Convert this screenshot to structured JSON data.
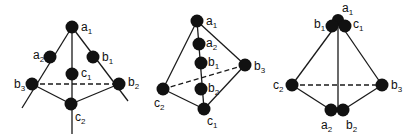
{
  "figures": [
    {
      "id": "fig1",
      "atoms": [
        {
          "name": "a1",
          "letter": "a",
          "sub": "1",
          "x": 72,
          "y": 27
        },
        {
          "name": "a2",
          "letter": "a",
          "sub": "2",
          "x": 50,
          "y": 57
        },
        {
          "name": "b1",
          "letter": "b",
          "sub": "1",
          "x": 93,
          "y": 57
        },
        {
          "name": "c1",
          "letter": "c",
          "sub": "1",
          "x": 72,
          "y": 74
        },
        {
          "name": "b3",
          "letter": "b",
          "sub": "3",
          "x": 32,
          "y": 84
        },
        {
          "name": "b2",
          "letter": "b",
          "sub": "2",
          "x": 119,
          "y": 84
        },
        {
          "name": "c2",
          "letter": "c",
          "sub": "2",
          "x": 71,
          "y": 104
        }
      ]
    },
    {
      "id": "fig2",
      "atoms": [
        {
          "name": "a1",
          "letter": "a",
          "sub": "1",
          "x": 197,
          "y": 21
        },
        {
          "name": "a2",
          "letter": "a",
          "sub": "2",
          "x": 199,
          "y": 44
        },
        {
          "name": "b1",
          "letter": "b",
          "sub": "1",
          "x": 201,
          "y": 63
        },
        {
          "name": "b3",
          "letter": "b",
          "sub": "3",
          "x": 245,
          "y": 65
        },
        {
          "name": "b2",
          "letter": "b",
          "sub": "2",
          "x": 201,
          "y": 89
        },
        {
          "name": "c2",
          "letter": "c",
          "sub": "2",
          "x": 163,
          "y": 89
        },
        {
          "name": "c1",
          "letter": "c",
          "sub": "1",
          "x": 204,
          "y": 109
        }
      ]
    },
    {
      "id": "fig3",
      "atoms": [
        {
          "name": "a1",
          "letter": "a",
          "sub": "1",
          "x": 338,
          "y": 20
        },
        {
          "name": "b1",
          "letter": "b",
          "sub": "1",
          "x": 332,
          "y": 25
        },
        {
          "name": "c1",
          "letter": "c",
          "sub": "1",
          "x": 345,
          "y": 25
        },
        {
          "name": "c2",
          "letter": "c",
          "sub": "2",
          "x": 292,
          "y": 85
        },
        {
          "name": "b3",
          "letter": "b",
          "sub": "3",
          "x": 382,
          "y": 85
        },
        {
          "name": "a2",
          "letter": "a",
          "sub": "2",
          "x": 331,
          "y": 110
        },
        {
          "name": "b2",
          "letter": "b",
          "sub": "2",
          "x": 343,
          "y": 110
        }
      ]
    }
  ],
  "labels": {
    "fig1": {
      "a1": {
        "letter": "a",
        "sub": "1"
      },
      "a2": {
        "letter": "a",
        "sub": "2"
      },
      "b1": {
        "letter": "b",
        "sub": "1"
      },
      "c1": {
        "letter": "c",
        "sub": "1"
      },
      "b3": {
        "letter": "b",
        "sub": "3"
      },
      "b2": {
        "letter": "b",
        "sub": "2"
      },
      "c2": {
        "letter": "c",
        "sub": "2"
      }
    },
    "fig2": {
      "a1": {
        "letter": "a",
        "sub": "1"
      },
      "a2": {
        "letter": "a",
        "sub": "2"
      },
      "b1": {
        "letter": "b",
        "sub": "1"
      },
      "b3": {
        "letter": "b",
        "sub": "3"
      },
      "b2": {
        "letter": "b",
        "sub": "2"
      },
      "c2": {
        "letter": "c",
        "sub": "2"
      },
      "c1": {
        "letter": "c",
        "sub": "1"
      }
    },
    "fig3": {
      "a1": {
        "letter": "a",
        "sub": "1"
      },
      "b1": {
        "letter": "b",
        "sub": "1"
      },
      "c1": {
        "letter": "c",
        "sub": "1"
      },
      "c2": {
        "letter": "c",
        "sub": "2"
      },
      "b3": {
        "letter": "b",
        "sub": "3"
      },
      "a2": {
        "letter": "a",
        "sub": "2"
      },
      "b2": {
        "letter": "b",
        "sub": "2"
      }
    }
  },
  "colors": {
    "atom": "#111111",
    "line": "#1a1a1a",
    "background": "#ffffff"
  }
}
